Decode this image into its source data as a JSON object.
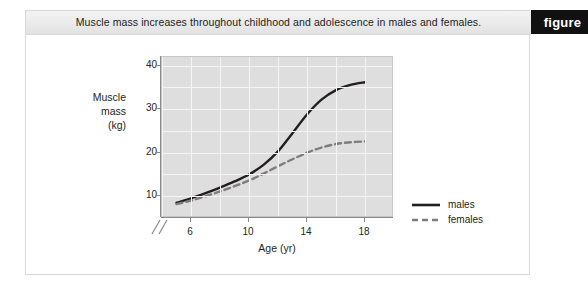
{
  "figure": {
    "title": "Muscle mass increases throughout childhood and adolescence in males and females.",
    "tab_label": "figure"
  },
  "chart_data": {
    "type": "line",
    "title": "Muscle mass increases throughout childhood and adolescence in males and females.",
    "xlabel": "Age (yr)",
    "ylabel": "Muscle mass (kg)",
    "ylabel_lines": [
      "Muscle",
      "mass",
      "(kg)"
    ],
    "xlim": [
      4,
      20
    ],
    "ylim": [
      5,
      42
    ],
    "xticks": [
      6,
      10,
      14,
      18
    ],
    "xtick_labels": [
      "6",
      "10",
      "14",
      "18"
    ],
    "yticks": [
      10,
      20,
      30,
      40
    ],
    "ytick_labels": [
      "10",
      "20",
      "30",
      "40"
    ],
    "grid": true,
    "axis_break_x": true,
    "legend_position": "right",
    "plot_background": "#dedede",
    "gridline_color": "#f4f4f4",
    "x": [
      5,
      6,
      7,
      8,
      9,
      10,
      11,
      12,
      13,
      14,
      15,
      16,
      17,
      18
    ],
    "series": [
      {
        "name": "males",
        "style": "solid",
        "color": "#231f20",
        "values": [
          8.5,
          9.5,
          10.7,
          12.0,
          13.4,
          15.0,
          17.2,
          20.3,
          24.5,
          28.8,
          32.2,
          34.4,
          35.6,
          36.2
        ]
      },
      {
        "name": "females",
        "style": "dashed",
        "color": "#7d7d7d",
        "values": [
          8.2,
          9.0,
          10.0,
          11.1,
          12.3,
          13.6,
          15.2,
          16.9,
          18.5,
          20.0,
          21.2,
          22.0,
          22.4,
          22.6
        ]
      }
    ],
    "legend": [
      {
        "label": "males",
        "style": "solid",
        "color": "#231f20"
      },
      {
        "label": "females",
        "style": "dashed",
        "color": "#7d7d7d"
      }
    ]
  }
}
